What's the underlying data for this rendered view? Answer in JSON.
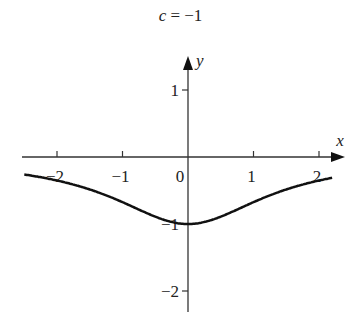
{
  "chart_data": {
    "type": "line",
    "title": "c = −1",
    "title_var": "c",
    "title_value": "= −1",
    "xlabel": "x",
    "ylabel": "y",
    "xlim": [
      -2.5,
      2.3
    ],
    "ylim": [
      -2.3,
      1.6
    ],
    "x_ticks": [
      -2,
      -1,
      1,
      2
    ],
    "x_tick_labels": [
      "−2",
      "−1",
      "1",
      "2"
    ],
    "y_ticks": [
      1,
      -1,
      -2
    ],
    "y_tick_labels": [
      "1",
      "−1",
      "−2"
    ],
    "origin_label": "0",
    "grid": false,
    "legend": null,
    "series": [
      {
        "name": "curve",
        "x": [
          -2.5,
          -2,
          -1.5,
          -1,
          -0.5,
          0,
          0.5,
          1,
          1.5,
          2,
          2.2
        ],
        "y": [
          -0.25,
          -0.33,
          -0.45,
          -0.62,
          -0.88,
          -1.0,
          -0.88,
          -0.62,
          -0.45,
          -0.33,
          -0.3
        ]
      }
    ]
  }
}
